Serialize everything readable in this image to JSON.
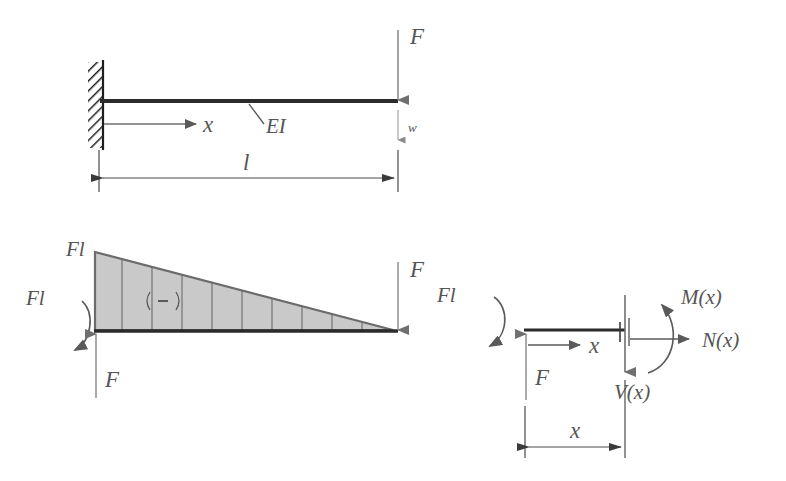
{
  "figure": {
    "colors": {
      "beam": "#2b2b2b",
      "arrow_gray": "#6f6f6f",
      "diagram_fill": "#c9c9c9",
      "diagram_edge": "#6b6b6b",
      "dimension_line": "#5a5a5a",
      "hatch": "#1f1f1f",
      "label_text": "#555555",
      "background": "#ffffff"
    },
    "panels": {
      "beam_model": {
        "name": "cantilever-beam-model",
        "labels": {
          "axis_x": "x",
          "stiffness": "EI",
          "load_F": "F",
          "deflection_w": "w",
          "span_l": "l"
        }
      },
      "moment_diagram": {
        "name": "bending-moment-diagram",
        "labels": {
          "peak_value": "Fl",
          "moment_reaction": "Fl",
          "reaction_F": "F",
          "load_F": "F",
          "sign": "(-)"
        },
        "divisions": 10,
        "shape": "triangle",
        "peak_at": "fixed-end",
        "zero_at": "free-end"
      },
      "free_body": {
        "name": "free-body-section-diagram",
        "labels": {
          "moment_reaction": "Fl",
          "reaction_F": "F",
          "axis_x": "x",
          "bending_moment": "M(x)",
          "normal_force": "N(x)",
          "shear_force": "V(x)",
          "dimension_x": "x"
        }
      }
    }
  }
}
